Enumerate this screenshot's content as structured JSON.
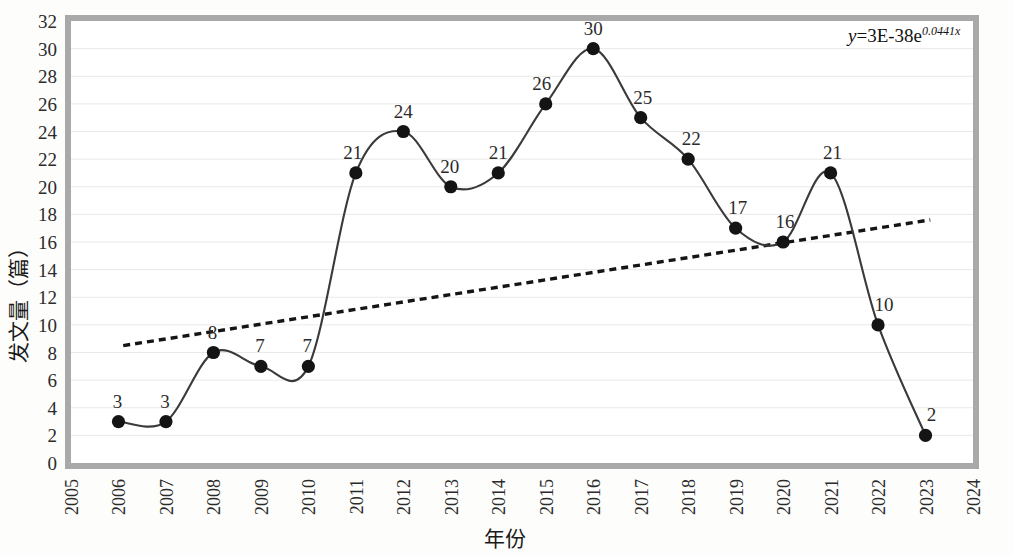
{
  "chart_data": {
    "type": "line",
    "title": "",
    "xlabel": "年份",
    "ylabel": "发文量（篇）",
    "x": [
      2006,
      2007,
      2008,
      2009,
      2010,
      2011,
      2012,
      2013,
      2014,
      2015,
      2016,
      2017,
      2018,
      2019,
      2020,
      2021,
      2022,
      2023
    ],
    "categories": [
      "2006",
      "2007",
      "2008",
      "2009",
      "2010",
      "2011",
      "2012",
      "2013",
      "2014",
      "2015",
      "2016",
      "2017",
      "2018",
      "2019",
      "2020",
      "2021",
      "2022",
      "2023"
    ],
    "values": [
      3,
      3,
      8,
      7,
      7,
      21,
      24,
      20,
      21,
      26,
      30,
      25,
      22,
      17,
      16,
      21,
      10,
      2
    ],
    "point_labels": [
      "3",
      "3",
      "8",
      "7",
      "7",
      "21",
      "24",
      "20",
      "21",
      "26",
      "30",
      "25",
      "22",
      "17",
      "16",
      "21",
      "10",
      "2"
    ],
    "xlim": [
      2005,
      2024
    ],
    "ylim": [
      0,
      32
    ],
    "ytick_step": 2,
    "yticks": [
      "0",
      "2",
      "4",
      "6",
      "8",
      "10",
      "12",
      "14",
      "16",
      "18",
      "20",
      "22",
      "24",
      "26",
      "28",
      "30",
      "32"
    ],
    "xticks": [
      "2005",
      "2006",
      "2007",
      "2008",
      "2009",
      "2010",
      "2011",
      "2012",
      "2013",
      "2014",
      "2015",
      "2016",
      "2017",
      "2018",
      "2019",
      "2020",
      "2021",
      "2022",
      "2023",
      "2024"
    ],
    "grid": true,
    "legend": "none",
    "series": [
      {
        "name": "发文量",
        "style": "smooth-line-with-markers",
        "values": [
          3,
          3,
          8,
          7,
          7,
          21,
          24,
          20,
          21,
          26,
          30,
          25,
          22,
          17,
          16,
          21,
          10,
          2
        ]
      },
      {
        "name": "指数趋势线",
        "style": "dashed-trendline",
        "equation": "y=3E-38e^0.0441x",
        "start": {
          "x": 2006.1,
          "y": 8.5
        },
        "end": {
          "x": 2023.1,
          "y": 17.6
        }
      }
    ],
    "annotations": [
      {
        "name": "trendline-equation",
        "text_prefix": "y",
        "text_main": "=3E-38e",
        "text_exponent": "0.0441x",
        "full_text": "y=3E-38e0.0441x"
      }
    ],
    "colors": {
      "line": "#3a3a3a",
      "marker": "#141414",
      "trendline": "#151515",
      "grid": "#e9e9e7",
      "border": "#a9a9a9",
      "plot_background": "#ffffff",
      "page_background": "#fdfdfc"
    }
  }
}
